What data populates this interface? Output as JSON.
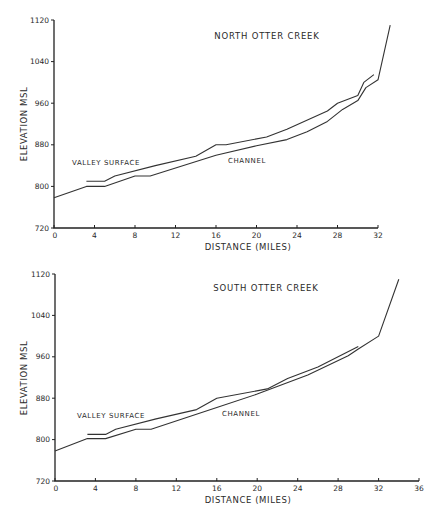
{
  "chart_data": [
    {
      "type": "line",
      "title": "NORTH OTTER CREEK",
      "xlabel": "DISTANCE (MILES)",
      "ylabel": "ELEVATION MSL",
      "xlim": [
        0,
        32
      ],
      "ylim": [
        720,
        1120
      ],
      "xticks": [
        0,
        4,
        8,
        12,
        16,
        20,
        24,
        28,
        32
      ],
      "yticks": [
        720,
        800,
        880,
        960,
        1040,
        1120
      ],
      "grid": false,
      "annotations": [
        "VALLEY SURFACE",
        "CHANNEL"
      ],
      "series": [
        {
          "name": "CHANNEL",
          "x": [
            0,
            3.2,
            5.0,
            8.0,
            9.5,
            16,
            20,
            23,
            25,
            27,
            28.5,
            30,
            30.8,
            32,
            33.2
          ],
          "y": [
            778,
            800,
            800,
            820,
            820,
            860,
            878,
            890,
            905,
            925,
            948,
            965,
            990,
            1005,
            1110
          ]
        },
        {
          "name": "VALLEY SURFACE",
          "x": [
            3.2,
            5.0,
            6.0,
            10,
            14,
            16,
            17,
            21,
            23,
            27,
            28,
            30,
            30.6,
            31.6
          ],
          "y": [
            810,
            810,
            820,
            840,
            858,
            880,
            880,
            895,
            910,
            945,
            960,
            975,
            1000,
            1015
          ]
        }
      ]
    },
    {
      "type": "line",
      "title": "SOUTH OTTER CREEK",
      "xlabel": "DISTANCE (MILES)",
      "ylabel": "ELEVATION MSL",
      "xlim": [
        0,
        36
      ],
      "ylim": [
        720,
        1120
      ],
      "xticks": [
        0,
        4,
        8,
        12,
        16,
        20,
        24,
        28,
        32,
        36
      ],
      "yticks": [
        720,
        800,
        880,
        960,
        1040,
        1120
      ],
      "grid": false,
      "annotations": [
        "VALLEY SURFACE",
        "CHANNEL"
      ],
      "series": [
        {
          "name": "CHANNEL",
          "x": [
            0,
            3.2,
            5.0,
            8.0,
            9.5,
            16,
            20,
            25,
            29,
            30,
            32,
            34
          ],
          "y": [
            778,
            802,
            802,
            820,
            820,
            862,
            888,
            925,
            962,
            975,
            1000,
            1110
          ]
        },
        {
          "name": "VALLEY SURFACE",
          "x": [
            3.2,
            5.0,
            6.0,
            10,
            14,
            16,
            21,
            23,
            26,
            30
          ],
          "y": [
            810,
            810,
            820,
            840,
            858,
            880,
            898,
            918,
            940,
            980
          ]
        }
      ]
    }
  ],
  "charts": [
    {
      "title": "NORTH OTTER CREEK",
      "xlabel": "DISTANCE  (MILES)",
      "ylabel": "ELEVATION   MSL",
      "valley_label": "VALLEY  SURFACE",
      "channel_label": "CHANNEL",
      "xtick_labels": [
        "0",
        "4",
        "8",
        "12",
        "16",
        "20",
        "24",
        "28",
        "32"
      ],
      "ytick_labels": [
        "720",
        "800",
        "880",
        "960",
        "1040",
        "1120"
      ]
    },
    {
      "title": "SOUTH OTTER CREEK",
      "xlabel": "DISTANCE  (MILES)",
      "ylabel": "ELEVATION   MSL",
      "valley_label": "VALLEY  SURFACE",
      "channel_label": "CHANNEL",
      "xtick_labels": [
        "0",
        "4",
        "8",
        "12",
        "16",
        "20",
        "24",
        "28",
        "32",
        "36"
      ],
      "ytick_labels": [
        "720",
        "800",
        "880",
        "960",
        "1040",
        "1120"
      ]
    }
  ]
}
